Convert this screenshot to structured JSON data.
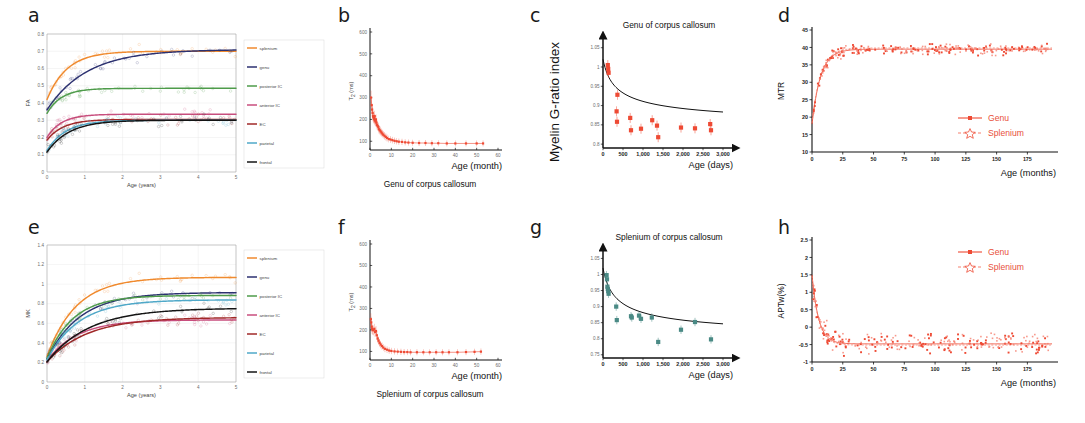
{
  "figure": {
    "panels": [
      "a",
      "b",
      "c",
      "d",
      "e",
      "f",
      "g",
      "h"
    ]
  },
  "series_colors": {
    "splenium": "#F08A2E",
    "genu": "#2C3170",
    "posterior_IC": "#4E9B4A",
    "anterior_IC": "#C84E7E",
    "EC": "#A02828",
    "parietal": "#4FA8C8",
    "frontal": "#141414",
    "red_marker": "#EE4A34",
    "teal_marker": "#4A8A85"
  },
  "panel_a": {
    "label": "a",
    "chart_data": {
      "type": "scatter",
      "title": "",
      "xlabel": "Age (years)",
      "ylabel": "FA",
      "xlim": [
        0,
        5
      ],
      "ylim": [
        0,
        0.8
      ],
      "xticks": [
        "0",
        "1",
        "2",
        "3",
        "4",
        "5"
      ],
      "yticks": [
        "0",
        "0.1",
        "0.2",
        "0.3",
        "0.4",
        "0.5",
        "0.6",
        "0.7",
        "0.8"
      ],
      "grid": true,
      "legend_position": "right",
      "series": [
        {
          "name": "splenium",
          "color": "#F08A2E",
          "asymptote": 0.7,
          "y0": 0.42,
          "rate": 1.9
        },
        {
          "name": "genu",
          "color": "#2C3170",
          "asymptote": 0.71,
          "y0": 0.36,
          "rate": 0.95
        },
        {
          "name": "posterior IC",
          "color": "#4E9B4A",
          "asymptote": 0.485,
          "y0": 0.34,
          "rate": 2.6
        },
        {
          "name": "anterior IC",
          "color": "#C84E7E",
          "asymptote": 0.335,
          "y0": 0.2,
          "rate": 2.6
        },
        {
          "name": "EC",
          "color": "#A02828",
          "asymptote": 0.305,
          "y0": 0.185,
          "rate": 2.3
        },
        {
          "name": "parietal",
          "color": "#4FA8C8",
          "asymptote": 0.3,
          "y0": 0.125,
          "rate": 2.0
        },
        {
          "name": "frontal",
          "color": "#141414",
          "asymptote": 0.3,
          "y0": 0.115,
          "rate": 1.7
        }
      ]
    }
  },
  "panel_b": {
    "label": "b",
    "caption": "Genu of corpus callosum",
    "chart_data": {
      "type": "scatter",
      "xlabel": "Age (month)",
      "ylabel": "T2 (ms)",
      "ylabel_sub": "2",
      "ylabel_main": "T",
      "ylabel_unit": " (ms)",
      "xlim": [
        0,
        60
      ],
      "ylim": [
        60,
        600
      ],
      "xticks": [
        "0",
        "10",
        "20",
        "30",
        "40",
        "50",
        "60"
      ],
      "yticks": [
        "100",
        "200",
        "300",
        "400",
        "500",
        "600"
      ],
      "marker_color": "#EE4A34",
      "points": [
        [
          0.5,
          300
        ],
        [
          0.8,
          265
        ],
        [
          1.0,
          245
        ],
        [
          1.2,
          230
        ],
        [
          1.4,
          215
        ],
        [
          1.6,
          210
        ],
        [
          1.8,
          205
        ],
        [
          2.0,
          200
        ],
        [
          2.2,
          215
        ],
        [
          2.4,
          195
        ],
        [
          2.6,
          190
        ],
        [
          2.8,
          200
        ],
        [
          3.0,
          185
        ],
        [
          3.3,
          175
        ],
        [
          3.6,
          170
        ],
        [
          3.9,
          165
        ],
        [
          4.2,
          155
        ],
        [
          4.6,
          150
        ],
        [
          5.0,
          145
        ],
        [
          5.4,
          140
        ],
        [
          5.8,
          135
        ],
        [
          6.2,
          130
        ],
        [
          6.8,
          125
        ],
        [
          7.4,
          120
        ],
        [
          8.0,
          115
        ],
        [
          8.8,
          110
        ],
        [
          9.6,
          108
        ],
        [
          10.5,
          105
        ],
        [
          11.5,
          102
        ],
        [
          12.5,
          100
        ],
        [
          13.5,
          98
        ],
        [
          15,
          97
        ],
        [
          16.5,
          95
        ],
        [
          18,
          94
        ],
        [
          20,
          93
        ],
        [
          23,
          92
        ],
        [
          26,
          92
        ],
        [
          29,
          91
        ],
        [
          32,
          91
        ],
        [
          36,
          90
        ],
        [
          40,
          90
        ],
        [
          45,
          90
        ],
        [
          50,
          90
        ],
        [
          53,
          90
        ]
      ]
    }
  },
  "panel_c": {
    "label": "c",
    "title": "Genu of corpus callosum",
    "chart_data": {
      "type": "scatter",
      "xlabel": "Age (days)",
      "ylabel": "Myelin G-ratio index",
      "xlim": [
        0,
        3000
      ],
      "ylim": [
        0.79,
        1.07
      ],
      "xticks": [
        "0",
        "500",
        "1,000",
        "1,500",
        "2,000",
        "2,500",
        "3,000"
      ],
      "yticks": [
        "0.8",
        "0.85",
        "0.9",
        "0.95",
        "1",
        "1.05"
      ],
      "marker_color": "#EE4A34",
      "points": [
        [
          120,
          1.005
        ],
        [
          130,
          0.995
        ],
        [
          140,
          0.985
        ],
        [
          340,
          0.885
        ],
        [
          350,
          0.858
        ],
        [
          360,
          0.928
        ],
        [
          680,
          0.868
        ],
        [
          700,
          0.836
        ],
        [
          950,
          0.84
        ],
        [
          1230,
          0.862
        ],
        [
          1350,
          0.848
        ],
        [
          1380,
          0.818
        ],
        [
          1950,
          0.843
        ],
        [
          2300,
          0.841
        ],
        [
          2680,
          0.852
        ],
        [
          2700,
          0.836
        ]
      ],
      "fit_label": "power-law decay"
    }
  },
  "panel_d": {
    "label": "d",
    "chart_data": {
      "type": "scatter",
      "xlabel": "Age (months)",
      "ylabel": "MTR",
      "xlim": [
        0,
        195
      ],
      "ylim": [
        10,
        45
      ],
      "xticks": [
        "0",
        "25",
        "50",
        "75",
        "100",
        "125",
        "150",
        "175"
      ],
      "yticks": [
        "10",
        "15",
        "20",
        "25",
        "30",
        "35",
        "40",
        "45"
      ],
      "legend": [
        {
          "name": "Genu",
          "marker": "filled-square",
          "style": "solid",
          "color": "#EE4A34"
        },
        {
          "name": "Splenium",
          "marker": "open-star",
          "style": "dashed",
          "color": "#F5806F"
        }
      ],
      "asymptote": 39.5,
      "y0": 18
    }
  },
  "panel_e": {
    "label": "e",
    "chart_data": {
      "type": "scatter",
      "xlabel": "Age (years)",
      "ylabel": "MK",
      "xlim": [
        0,
        5
      ],
      "ylim": [
        0,
        1.4
      ],
      "xticks": [
        "0",
        "1",
        "2",
        "3",
        "4",
        "5"
      ],
      "yticks": [
        "0",
        "0.2",
        "0.4",
        "0.6",
        "0.8",
        "1",
        "1.2",
        "1.4"
      ],
      "grid": true,
      "legend_position": "right",
      "series": [
        {
          "name": "splenium",
          "color": "#F08A2E",
          "asymptote": 1.07,
          "y0": 0.26,
          "rate": 1.3
        },
        {
          "name": "genu",
          "color": "#2C3170",
          "asymptote": 0.915,
          "y0": 0.235,
          "rate": 1.15
        },
        {
          "name": "posterior IC",
          "color": "#4E9B4A",
          "asymptote": 0.885,
          "y0": 0.24,
          "rate": 1.45
        },
        {
          "name": "anterior IC",
          "color": "#C84E7E",
          "asymptote": 0.635,
          "y0": 0.215,
          "rate": 1.25
        },
        {
          "name": "EC",
          "color": "#A02828",
          "asymptote": 0.66,
          "y0": 0.205,
          "rate": 0.95
        },
        {
          "name": "parietal",
          "color": "#4FA8C8",
          "asymptote": 0.84,
          "y0": 0.225,
          "rate": 1.2
        },
        {
          "name": "frontal",
          "color": "#141414",
          "asymptote": 0.755,
          "y0": 0.205,
          "rate": 0.9
        }
      ]
    }
  },
  "panel_f": {
    "label": "f",
    "caption": "Splenium of corpus callosum",
    "chart_data": {
      "type": "scatter",
      "xlabel": "Age (month)",
      "ylabel_main": "T",
      "ylabel_sub": "2",
      "ylabel_unit": " (ms)",
      "xlim": [
        0,
        60
      ],
      "ylim": [
        60,
        600
      ],
      "xticks": [
        "0",
        "10",
        "20",
        "30",
        "40",
        "50",
        "60"
      ],
      "yticks": [
        "100",
        "200",
        "300",
        "400",
        "500",
        "600"
      ],
      "marker_color": "#EE4A34",
      "points": [
        [
          0.4,
          250
        ],
        [
          0.6,
          235
        ],
        [
          0.8,
          215
        ],
        [
          1.0,
          205
        ],
        [
          1.3,
          200
        ],
        [
          1.6,
          198
        ],
        [
          2.0,
          205
        ],
        [
          2.4,
          190
        ],
        [
          2.8,
          195
        ],
        [
          3.2,
          175
        ],
        [
          3.6,
          160
        ],
        [
          4.0,
          150
        ],
        [
          4.5,
          140
        ],
        [
          5.0,
          132
        ],
        [
          5.6,
          125
        ],
        [
          6.2,
          118
        ],
        [
          7.0,
          112
        ],
        [
          8.0,
          108
        ],
        [
          9.0,
          104
        ],
        [
          10.0,
          102
        ],
        [
          11.5,
          100
        ],
        [
          13,
          99
        ],
        [
          14.5,
          98
        ],
        [
          16,
          97
        ],
        [
          17.5,
          97
        ],
        [
          19,
          96
        ],
        [
          22,
          96
        ],
        [
          25,
          96
        ],
        [
          28,
          96
        ],
        [
          31,
          96
        ],
        [
          34,
          96
        ],
        [
          37,
          96
        ],
        [
          41,
          96
        ],
        [
          45,
          97
        ],
        [
          49,
          98
        ],
        [
          52,
          99
        ]
      ]
    }
  },
  "panel_g": {
    "label": "g",
    "title": "Splenium of corpus callosum",
    "chart_data": {
      "type": "scatter",
      "xlabel": "Age (days)",
      "ylabel": "",
      "xlim": [
        0,
        3000
      ],
      "ylim": [
        0.74,
        1.07
      ],
      "xticks": [
        "0",
        "500",
        "1,000",
        "1,500",
        "2,000",
        "2,500",
        "3,000"
      ],
      "yticks": [
        "0.75",
        "0.8",
        "0.85",
        "0.9",
        "0.95",
        "1",
        "1.05"
      ],
      "marker_color": "#4A8A85",
      "points": [
        [
          90,
          0.998
        ],
        [
          100,
          0.985
        ],
        [
          110,
          0.962
        ],
        [
          120,
          0.955
        ],
        [
          130,
          0.948
        ],
        [
          140,
          0.94
        ],
        [
          330,
          0.9
        ],
        [
          345,
          0.858
        ],
        [
          700,
          0.87
        ],
        [
          720,
          0.866
        ],
        [
          900,
          0.872
        ],
        [
          950,
          0.862
        ],
        [
          1220,
          0.866
        ],
        [
          1380,
          0.79
        ],
        [
          1950,
          0.828
        ],
        [
          2300,
          0.852
        ],
        [
          2700,
          0.798
        ]
      ]
    }
  },
  "panel_h": {
    "label": "h",
    "chart_data": {
      "type": "scatter",
      "xlabel": "Age (months)",
      "ylabel": "APTw(%)",
      "xlim": [
        0,
        195
      ],
      "ylim": [
        -1,
        2.5
      ],
      "xticks": [
        "0",
        "25",
        "50",
        "75",
        "100",
        "125",
        "150",
        "175"
      ],
      "yticks": [
        "-1",
        "-0.5",
        "0",
        "0.5",
        "1",
        "1.5",
        "2",
        "2.5"
      ],
      "legend": [
        {
          "name": "Genu",
          "marker": "filled-square",
          "style": "solid",
          "color": "#EE4A34"
        },
        {
          "name": "Splenium",
          "marker": "open-star",
          "style": "dashed",
          "color": "#F5806F"
        }
      ],
      "asymptote": -0.48,
      "y0": 1.5
    }
  }
}
